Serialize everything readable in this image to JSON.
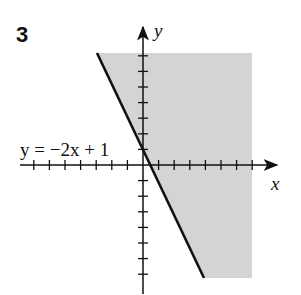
{
  "problem_number": "3",
  "equation_label": "y = −2x + 1",
  "axes": {
    "x_label": "x",
    "y_label": "y"
  },
  "colors": {
    "shade": "#d4d4d4",
    "line": "#111111",
    "axis": "#111111"
  },
  "graph": {
    "boundary": {
      "slope": -2,
      "intercept": 1,
      "style": "solid"
    },
    "shaded_region": "right of line (y >= -2x + 1)",
    "tick_spacing": 1,
    "x_ticks_negative": 7,
    "x_ticks_positive": 7,
    "y_ticks_positive": 7,
    "y_ticks_negative": 7
  }
}
